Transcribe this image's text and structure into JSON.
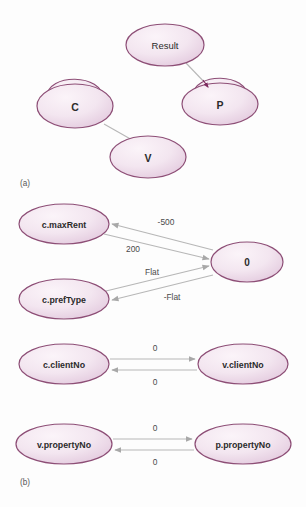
{
  "figure": {
    "background_color": "#fdfdfd",
    "node_fill_light": "#f6ecf3",
    "node_fill_mid": "#e8d3e2",
    "node_stroke": "#8d4e76",
    "edge_color": "#b0b0b0",
    "arrowhead_dark": "#7d2a5e",
    "label_color": "#4a4a4a"
  },
  "panels": [
    {
      "id": "panel-a",
      "caption": "(a)",
      "caption_x": 20,
      "caption_y": 183,
      "nodes": [
        {
          "id": "result",
          "label": "Result",
          "cx": 165,
          "cy": 45,
          "rx": 39,
          "ry": 21,
          "font_size": 9.5,
          "bold": false,
          "self_loop": false
        },
        {
          "id": "c",
          "label": "C",
          "cx": 75,
          "cy": 106,
          "rx": 38,
          "ry": 22,
          "font_size": 10.5,
          "bold": true,
          "self_loop": true
        },
        {
          "id": "p",
          "label": "P",
          "cx": 220,
          "cy": 104,
          "rx": 38,
          "ry": 21,
          "font_size": 10.5,
          "bold": true,
          "self_loop": true
        },
        {
          "id": "v",
          "label": "V",
          "cx": 148,
          "cy": 157,
          "rx": 38,
          "ry": 21,
          "font_size": 10.5,
          "bold": true,
          "self_loop": false
        }
      ],
      "edges": [
        {
          "id": "result-to-p",
          "from": "result",
          "to": "p",
          "label": "",
          "x1": 186,
          "y1": 63,
          "x2": 207,
          "y2": 85,
          "arrow": "end"
        },
        {
          "id": "c-to-v",
          "from": "c",
          "to": "v",
          "label": "",
          "x1": 105,
          "y1": 124,
          "x2": 133,
          "y2": 140,
          "arrow": "none"
        }
      ],
      "self_loops": [
        {
          "id": "c-self-loop",
          "node": "c",
          "label": ""
        },
        {
          "id": "p-self-loop",
          "node": "p",
          "label": ""
        }
      ]
    },
    {
      "id": "panel-b",
      "caption": "(b)",
      "caption_x": 20,
      "caption_y": 482,
      "nodes": [
        {
          "id": "c-maxrent",
          "label": "c.maxRent",
          "cx": 64,
          "cy": 224,
          "rx": 45,
          "ry": 20,
          "font_size": 8.8,
          "bold": true,
          "self_loop": false
        },
        {
          "id": "zero",
          "label": "0",
          "cx": 247,
          "cy": 262,
          "rx": 36,
          "ry": 20,
          "font_size": 10,
          "bold": true,
          "self_loop": false
        },
        {
          "id": "c-preftype",
          "label": "c.prefType",
          "cx": 64,
          "cy": 299,
          "rx": 45,
          "ry": 20,
          "font_size": 8.8,
          "bold": true,
          "self_loop": false
        },
        {
          "id": "c-clientno",
          "label": "c.clientNo",
          "cx": 64,
          "cy": 364,
          "rx": 45,
          "ry": 20,
          "font_size": 8.8,
          "bold": true,
          "self_loop": false
        },
        {
          "id": "v-clientno",
          "label": "v.clientNo",
          "cx": 243,
          "cy": 364,
          "rx": 45,
          "ry": 20,
          "font_size": 8.8,
          "bold": true,
          "self_loop": false
        },
        {
          "id": "v-propertyno",
          "label": "v.propertyNo",
          "cx": 64,
          "cy": 444,
          "rx": 48,
          "ry": 20,
          "font_size": 8.8,
          "bold": true,
          "self_loop": false
        },
        {
          "id": "p-propertyno",
          "label": "p.propertyNo",
          "cx": 243,
          "cy": 444,
          "rx": 48,
          "ry": 20,
          "font_size": 8.8,
          "bold": true,
          "self_loop": false
        }
      ],
      "edges": [
        {
          "id": "zero-to-maxrent",
          "from": "zero",
          "to": "c-maxrent",
          "label": "-500",
          "label_x": 166,
          "label_y": 222,
          "x1": 212,
          "y1": 250,
          "x2": 110,
          "y2": 224,
          "arrow": "end"
        },
        {
          "id": "maxrent-to-zero",
          "from": "c-maxrent",
          "to": "zero",
          "label": "200",
          "label_x": 133,
          "label_y": 249,
          "x1": 104,
          "y1": 233,
          "x2": 211,
          "y2": 259,
          "arrow": "end"
        },
        {
          "id": "preftype-to-zero",
          "from": "c-preftype",
          "to": "zero",
          "label": "Flat",
          "label_x": 152,
          "label_y": 272,
          "x1": 106,
          "y1": 291,
          "x2": 211,
          "y2": 266,
          "arrow": "end"
        },
        {
          "id": "zero-to-preftype",
          "from": "zero",
          "to": "c-preftype",
          "label": "-Flat",
          "label_x": 172,
          "label_y": 297,
          "x1": 212,
          "y1": 275,
          "x2": 110,
          "y2": 300,
          "arrow": "end"
        },
        {
          "id": "clientno-to-vclientno",
          "from": "c-clientno",
          "to": "v-clientno",
          "label": "0",
          "label_x": 155,
          "label_y": 348,
          "x1": 110,
          "y1": 359,
          "x2": 197,
          "y2": 359,
          "arrow": "end"
        },
        {
          "id": "vclientno-to-clientno",
          "from": "v-clientno",
          "to": "c-clientno",
          "label": "0",
          "label_x": 155,
          "label_y": 382,
          "x1": 197,
          "y1": 370,
          "x2": 110,
          "y2": 370,
          "arrow": "end"
        },
        {
          "id": "vprop-to-pprop",
          "from": "v-propertyno",
          "to": "p-propertyno",
          "label": "0",
          "label_x": 155,
          "label_y": 428,
          "x1": 113,
          "y1": 439,
          "x2": 194,
          "y2": 439,
          "arrow": "end"
        },
        {
          "id": "pprop-to-vprop",
          "from": "p-propertyno",
          "to": "v-propertyno",
          "label": "0",
          "label_x": 155,
          "label_y": 462,
          "x1": 194,
          "y1": 450,
          "x2": 113,
          "y2": 450,
          "arrow": "end"
        }
      ]
    }
  ]
}
